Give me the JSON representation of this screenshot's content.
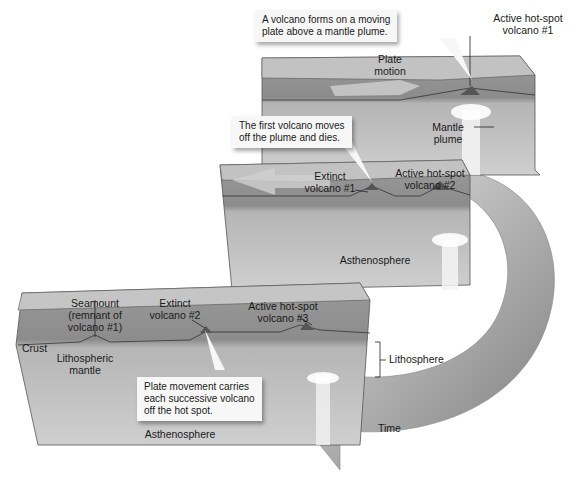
{
  "diagram": {
    "type": "hot-spot volcano chain over time",
    "stages": [
      {
        "id": "stage-1",
        "callout": [
          "A volcano forms on a moving",
          "plate above a mantle plume."
        ],
        "labels": {
          "active_volcano": [
            "Active hot-spot",
            "volcano #1"
          ],
          "plate_motion": [
            "Plate",
            "motion"
          ],
          "mantle_plume": [
            "Mantle",
            "plume"
          ]
        }
      },
      {
        "id": "stage-2",
        "callout": [
          "The first volcano moves",
          "off the plume and dies."
        ],
        "labels": {
          "extinct_volcano": [
            "Extinct",
            "volcano #1"
          ],
          "active_volcano": [
            "Active hot-spot",
            "volcano #2"
          ],
          "asthenosphere": "Asthenosphere"
        }
      },
      {
        "id": "stage-3",
        "callout": [
          "Plate movement carries",
          "each successive volcano",
          "off the hot spot."
        ],
        "labels": {
          "seamount": [
            "Seamount",
            "(remnant of",
            "volcano #1)"
          ],
          "extinct_volcano": [
            "Extinct",
            "volcano #2"
          ],
          "active_volcano": [
            "Active hot-spot",
            "volcano #3"
          ],
          "crust": "Crust",
          "lithospheric_mantle": [
            "Lithospheric",
            "mantle"
          ],
          "asthenosphere": "Asthenosphere",
          "lithosphere": "Lithosphere"
        }
      }
    ],
    "time_arrow_label": "Time",
    "colors": {
      "crust": "#b9b9b9",
      "lithosphere": "#8f8f8f",
      "asthenosphere": "#c4c4c4",
      "plume": "#f4f4f4",
      "time_arrow": "#9a9a9a",
      "callout_bg": "#f7f7f7"
    }
  }
}
